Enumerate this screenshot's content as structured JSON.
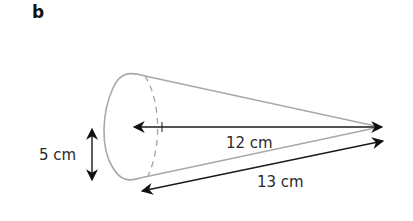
{
  "figure": {
    "part_label": "b",
    "shape": "cone",
    "dimensions": {
      "radius": "5 cm",
      "height": "12 cm",
      "slant_height": "13 cm"
    },
    "colors": {
      "outline": "#a8a8a8",
      "arrows": "#1a1a1a",
      "text": "#2a2a2a"
    }
  }
}
